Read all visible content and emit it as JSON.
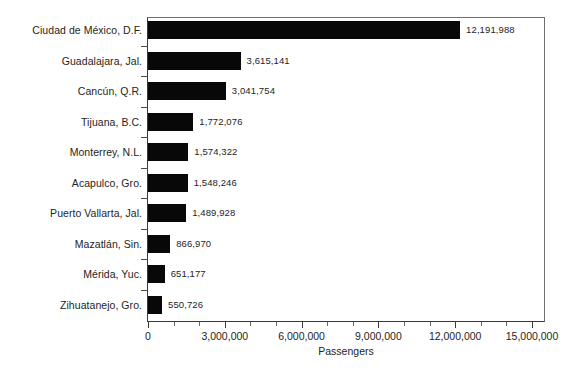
{
  "chart_data": {
    "type": "bar",
    "orientation": "horizontal",
    "title": "",
    "xlabel": "Passengers",
    "ylabel": "",
    "xlim": [
      0,
      15000000
    ],
    "grid": false,
    "legend": null,
    "bar_color": "#080808",
    "categories": [
      "Ciudad de México, D.F.",
      "Guadalajara, Jal.",
      "Cancún, Q.R.",
      "Tijuana, B.C.",
      "Monterrey, N.L.",
      "Acapulco, Gro.",
      "Puerto Vallarta, Jal.",
      "Mazatlán, Sin.",
      "Mérida, Yuc.",
      "Zihuatanejo, Gro."
    ],
    "values": [
      12191988,
      3615141,
      3041754,
      1772076,
      1574322,
      1548246,
      1489928,
      866970,
      651177,
      550726
    ],
    "value_labels": [
      "12,191,988",
      "3,615,141",
      "3,041,754",
      "1,772,076",
      "1,574,322",
      "1,548,246",
      "1,489,928",
      "866,970",
      "651,177",
      "550,726"
    ],
    "xticks": [
      0,
      3000000,
      6000000,
      9000000,
      12000000,
      15000000
    ],
    "xtick_labels": [
      "0",
      "3,000,000",
      "6,000,000",
      "9,000,000",
      "12,000,000",
      "15,000,000"
    ],
    "minor_xticks": [
      1000000,
      2000000,
      4000000,
      5000000,
      7000000,
      8000000,
      10000000,
      11000000,
      13000000,
      14000000
    ]
  }
}
